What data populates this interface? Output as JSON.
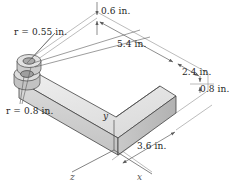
{
  "figure": {
    "type": "isometric-engineering-drawing",
    "background": "#ffffff"
  },
  "dimensions": [
    {
      "id": "thickness_top",
      "label": "0.6 in.",
      "value": 0.6,
      "unit": "in."
    },
    {
      "id": "length_long",
      "label": "5.4 in.",
      "value": 5.4,
      "unit": "in."
    },
    {
      "id": "width_arm",
      "label": "2.4 in.",
      "value": 2.4,
      "unit": "in."
    },
    {
      "id": "height_block",
      "label": "0.8 in.",
      "value": 0.8,
      "unit": "in."
    },
    {
      "id": "length_front",
      "label": "3.6 in.",
      "value": 3.6,
      "unit": "in."
    }
  ],
  "radii": [
    {
      "id": "hole_radius",
      "label": "r = 0.55 in.",
      "value": 0.55,
      "unit": "in."
    },
    {
      "id": "boss_radius",
      "label": "r = 0.8 in.",
      "value": 0.8,
      "unit": "in."
    }
  ],
  "axes": [
    {
      "id": "x",
      "label": "x"
    },
    {
      "id": "y",
      "label": "y"
    },
    {
      "id": "z",
      "label": "z"
    }
  ],
  "colors": {
    "outline": "#3a3a3a",
    "dimension_line": "#6e6e6e",
    "face_top": "#e9e9e9",
    "face_front": "#d2d2d2",
    "face_side": "#bdbdbd",
    "boss_top": "#e0e0e0",
    "boss_side": "#c4c4c4",
    "hole": "#a8a8a8",
    "text": "#262626"
  }
}
